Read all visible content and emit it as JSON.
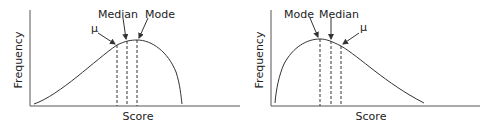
{
  "figures": [
    {
      "skew": "negative",
      "xlabel": "Score",
      "ylabel": "Frequency",
      "labels": {
        "mean": "μ",
        "median": "Median",
        "mode": "Mode"
      }
    },
    {
      "skew": "positive",
      "xlabel": "Score",
      "ylabel": "Frequency",
      "labels": {
        "mean": "μ",
        "median": "Median",
        "mode": "Mode"
      }
    }
  ],
  "colors": {
    "line": "#333333",
    "axis": "#555555"
  }
}
